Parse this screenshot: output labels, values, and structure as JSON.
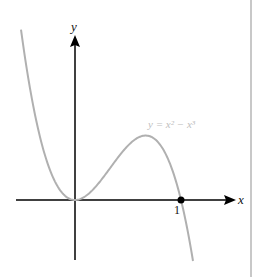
{
  "chart_data": {
    "type": "line",
    "title": "",
    "xlabel": "x",
    "ylabel": "y",
    "series": [
      {
        "name": "y = x^2 - x^3",
        "function": "x^2 - x^3"
      }
    ],
    "annotation": {
      "label": "y = x² − x³"
    },
    "marked_point": {
      "x": 1,
      "y": 0,
      "label": "1"
    },
    "x_ticks": [
      "1"
    ],
    "xlim": [
      -0.55,
      1.6
    ],
    "ylim": [
      -0.35,
      0.42
    ],
    "grid": false,
    "legend": "none",
    "colors": {
      "curve": "#b0b0b0",
      "axes": "#000000"
    }
  },
  "labels": {
    "x_axis": "x",
    "y_axis": "y",
    "equation": "y = x² − x³",
    "tick_one": "1"
  }
}
